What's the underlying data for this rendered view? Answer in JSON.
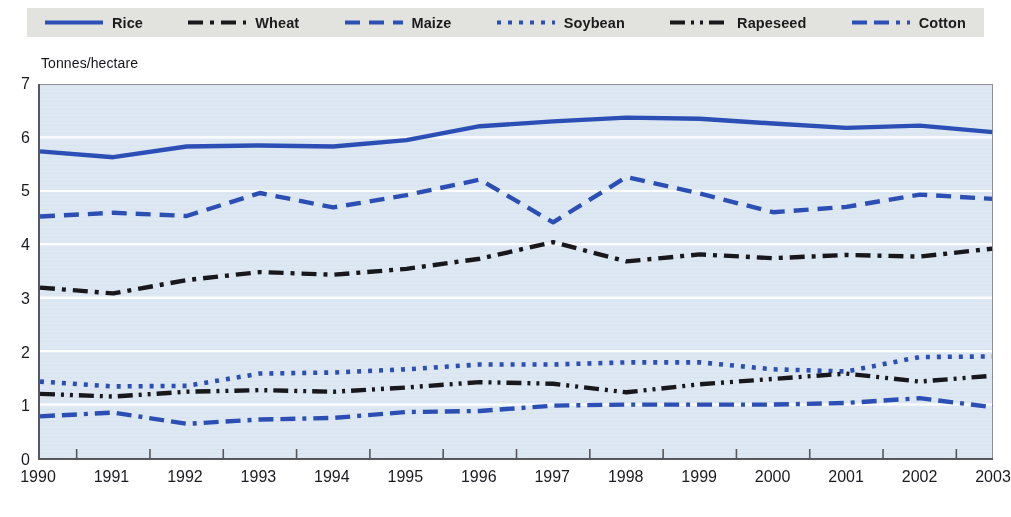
{
  "legend": {
    "position": "top",
    "items": [
      {
        "label": "Rice",
        "color": "#2b4fb5",
        "style": "solid",
        "icon": "line-solid-icon"
      },
      {
        "label": "Wheat",
        "color": "#17171c",
        "style": "dash-dot",
        "icon": "line-dash-dot-icon"
      },
      {
        "label": "Maize",
        "color": "#2b4fb5",
        "style": "dashed",
        "icon": "line-dashed-icon"
      },
      {
        "label": "Soybean",
        "color": "#2b4fb5",
        "style": "dotted",
        "icon": "line-dotted-icon"
      },
      {
        "label": "Rapeseed",
        "color": "#17171c",
        "style": "dash-dot-dot",
        "icon": "line-dash-dot-dot-icon"
      },
      {
        "label": "Cotton",
        "color": "#2b4fb5",
        "style": "dash-dash-dot",
        "icon": "line-dash-dash-dot-icon"
      }
    ]
  },
  "axis": {
    "y_unit_label": "Tonnes/hectare",
    "y_ticks": [
      "0",
      "1",
      "2",
      "3",
      "4",
      "5",
      "6",
      "7"
    ],
    "x_ticks": [
      "1990",
      "1991",
      "1992",
      "1993",
      "1994",
      "1995",
      "1996",
      "1997",
      "1998",
      "1999",
      "2000",
      "2001",
      "2002",
      "2003"
    ]
  },
  "colors": {
    "plot_background": "#dde8f3",
    "gridline": "#ffffff",
    "axis_line": "#57575d",
    "legend_background": "#e2e2de",
    "blue": "#2b4fb5",
    "black": "#17171c"
  },
  "chart_data": {
    "type": "line",
    "title": "",
    "subtitle": "",
    "xlabel": "",
    "ylabel": "Tonnes/hectare",
    "ylim": [
      0,
      7
    ],
    "ytick_step": 1,
    "grid": true,
    "legend_position": "top",
    "x": [
      1990,
      1991,
      1992,
      1993,
      1994,
      1995,
      1996,
      1997,
      1998,
      1999,
      2000,
      2001,
      2002,
      2003
    ],
    "categories": [
      "1990",
      "1991",
      "1992",
      "1993",
      "1994",
      "1995",
      "1996",
      "1997",
      "1998",
      "1999",
      "2000",
      "2001",
      "2002",
      "2003"
    ],
    "series": [
      {
        "name": "Rice",
        "color": "#2b4fb5",
        "style": "solid",
        "values": [
          5.74,
          5.63,
          5.83,
          5.85,
          5.83,
          5.95,
          6.21,
          6.3,
          6.37,
          6.35,
          6.26,
          6.18,
          6.22,
          6.1
        ]
      },
      {
        "name": "Wheat",
        "color": "#17171c",
        "style": "dash-dot",
        "values": [
          3.19,
          3.08,
          3.33,
          3.48,
          3.43,
          3.54,
          3.73,
          4.04,
          3.68,
          3.81,
          3.74,
          3.8,
          3.77,
          3.92
        ]
      },
      {
        "name": "Maize",
        "color": "#2b4fb5",
        "style": "dashed",
        "values": [
          4.52,
          4.59,
          4.53,
          4.96,
          4.69,
          4.92,
          5.21,
          4.41,
          5.26,
          4.95,
          4.6,
          4.7,
          4.93,
          4.85
        ]
      },
      {
        "name": "Soybean",
        "color": "#2b4fb5",
        "style": "dotted",
        "values": [
          1.43,
          1.34,
          1.35,
          1.58,
          1.6,
          1.66,
          1.75,
          1.75,
          1.79,
          1.79,
          1.66,
          1.62,
          1.89,
          1.9
        ]
      },
      {
        "name": "Rapeseed",
        "color": "#17171c",
        "style": "dash-dot-dot",
        "values": [
          1.2,
          1.15,
          1.24,
          1.27,
          1.24,
          1.32,
          1.42,
          1.39,
          1.23,
          1.38,
          1.48,
          1.58,
          1.43,
          1.54
        ]
      },
      {
        "name": "Cotton",
        "color": "#2b4fb5",
        "style": "dash-dash-dot",
        "values": [
          0.78,
          0.85,
          0.64,
          0.72,
          0.75,
          0.86,
          0.88,
          0.98,
          1.0,
          1.0,
          1.0,
          1.03,
          1.12,
          0.95
        ]
      }
    ]
  }
}
